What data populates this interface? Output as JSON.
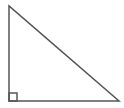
{
  "diagram": {
    "shape": "right-triangle",
    "stroke_color": "#555555",
    "stroke_width": 1.5,
    "fill": "#ffffff",
    "vertices": {
      "top": [
        9,
        6
      ],
      "right_angle": [
        9,
        101
      ],
      "bottom_right": [
        119,
        101
      ]
    },
    "right_angle_marker": {
      "x": 9,
      "y": 93,
      "size": 8
    }
  }
}
